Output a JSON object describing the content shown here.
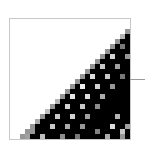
{
  "figure": {
    "rows": 24,
    "cols": 24,
    "cell_px": 5,
    "frame_color": "#c8c8c8",
    "tick_color": "#9a9a9a",
    "boundary_start_col": [
      24,
      24,
      23,
      22,
      21,
      20,
      19,
      18,
      17,
      16,
      15,
      14,
      13,
      12,
      11,
      10,
      9,
      8,
      7,
      6,
      5,
      4,
      3,
      2
    ],
    "spots": [
      [
        3,
        22,
        180
      ],
      [
        4,
        20,
        140
      ],
      [
        5,
        22,
        120
      ],
      [
        6,
        18,
        200
      ],
      [
        7,
        20,
        210
      ],
      [
        7,
        23,
        150
      ],
      [
        8,
        16,
        230
      ],
      [
        9,
        18,
        200
      ],
      [
        9,
        21,
        160
      ],
      [
        10,
        14,
        240
      ],
      [
        11,
        16,
        220
      ],
      [
        11,
        19,
        200
      ],
      [
        11,
        22,
        120
      ],
      [
        12,
        12,
        200
      ],
      [
        13,
        14,
        240
      ],
      [
        13,
        17,
        210
      ],
      [
        13,
        20,
        150
      ],
      [
        14,
        10,
        220
      ],
      [
        15,
        12,
        230
      ],
      [
        15,
        15,
        220
      ],
      [
        15,
        18,
        170
      ],
      [
        16,
        9,
        180
      ],
      [
        17,
        11,
        210
      ],
      [
        17,
        14,
        200
      ],
      [
        17,
        17,
        140
      ],
      [
        18,
        7,
        190
      ],
      [
        19,
        9,
        200
      ],
      [
        19,
        12,
        210
      ],
      [
        19,
        15,
        160
      ],
      [
        19,
        21,
        180
      ],
      [
        20,
        5,
        170
      ],
      [
        21,
        8,
        200
      ],
      [
        21,
        11,
        170
      ],
      [
        21,
        14,
        150
      ],
      [
        21,
        20,
        220
      ],
      [
        21,
        23,
        160
      ],
      [
        22,
        4,
        150
      ],
      [
        22,
        17,
        130
      ],
      [
        22,
        22,
        200
      ],
      [
        23,
        3,
        160
      ],
      [
        23,
        6,
        190
      ],
      [
        23,
        10,
        140
      ],
      [
        23,
        13,
        120
      ],
      [
        23,
        19,
        170
      ],
      [
        23,
        22,
        150
      ]
    ],
    "edge_gray": 150
  }
}
